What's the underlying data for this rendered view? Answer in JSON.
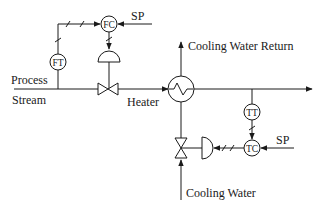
{
  "diagram": {
    "type": "P&ID - cascade/feedforward heater control",
    "labels": {
      "process_stream_line1": "Process",
      "process_stream_line2": "Stream",
      "heater": "Heater",
      "cooling_water_return": "Cooling Water Return",
      "cooling_water": "Cooling Water",
      "sp_top": "SP",
      "sp_bottom": "SP"
    },
    "instruments": {
      "ft": "FT",
      "fc": "FC",
      "tt": "TT",
      "tc": "TC"
    },
    "colors": {
      "line": "#1a1a1a",
      "background": "#ffffff"
    }
  }
}
